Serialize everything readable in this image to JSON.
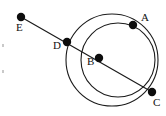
{
  "figure": {
    "type": "geometry-diagram",
    "width": 166,
    "height": 116,
    "background_color": "#ffffff",
    "stroke_color": "#1b1b1b",
    "point_color": "#0d0d0d",
    "label_color": "#111111"
  },
  "points": [
    {
      "id": "A",
      "label": "A",
      "x": 133,
      "y": 25,
      "label_x": 141,
      "label_y": 21,
      "radius": 4.2
    },
    {
      "id": "B",
      "label": "B",
      "x": 99,
      "y": 58,
      "label_x": 87,
      "label_y": 65,
      "radius": 4.2
    },
    {
      "id": "C",
      "label": "C",
      "x": 152,
      "y": 92,
      "label_x": 153,
      "label_y": 106,
      "radius": 4.2
    },
    {
      "id": "D",
      "label": "D",
      "x": 67,
      "y": 42,
      "label_x": 53,
      "label_y": 49,
      "radius": 4.2
    },
    {
      "id": "E",
      "label": "E",
      "x": 21,
      "y": 17,
      "label_x": 16,
      "label_y": 31,
      "radius": 4.2
    }
  ],
  "lines": [
    {
      "id": "line-EC",
      "from": "E",
      "to": "C",
      "x1": 21,
      "y1": 17,
      "x2": 152,
      "y2": 92
    }
  ],
  "circles": [
    {
      "id": "large-circle",
      "through": "D, A, C",
      "cx": 112,
      "cy": 60,
      "r": 46
    },
    {
      "id": "small-circle",
      "through": "B, A, C",
      "cx": 118,
      "cy": 60,
      "r": 37
    }
  ],
  "specks": [
    {
      "id": "speck-upper",
      "x": 2,
      "y": 44,
      "w": 2,
      "h": 3
    },
    {
      "id": "speck-lower",
      "x": 2,
      "y": 70,
      "w": 2,
      "h": 3
    }
  ]
}
